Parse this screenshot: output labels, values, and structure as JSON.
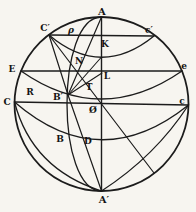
{
  "figure": {
    "background": "#f7f5f0",
    "stroke_color": "#1c1c1c",
    "canvas": {
      "width": 196,
      "height": 212
    },
    "circle": {
      "cx": 101.5,
      "cy": 104,
      "r": 87
    },
    "lines": [
      {
        "id": "axis-A-Aprime",
        "x1": 101.5,
        "y1": 17,
        "x2": 101.5,
        "y2": 191,
        "w": 1.4
      },
      {
        "id": "diameter-C-c",
        "x1": 14.5,
        "y1": 102,
        "x2": 188.5,
        "y2": 105,
        "w": 1.4
      },
      {
        "id": "chord-Cprime-cprime",
        "x1": 49,
        "y1": 35,
        "x2": 154,
        "y2": 36,
        "w": 1.3
      },
      {
        "id": "chord-E-e",
        "x1": 21,
        "y1": 71,
        "x2": 182,
        "y2": 71,
        "w": 1.3
      },
      {
        "id": "diameter-from-Cprime",
        "x1": 49,
        "y1": 35,
        "x2": 154,
        "y2": 173,
        "w": 1.2
      },
      {
        "id": "ray-Bprime-Cprime",
        "x1": 68,
        "y1": 95,
        "x2": 49,
        "y2": 35,
        "w": 1.2
      },
      {
        "id": "ray-Bprime-A",
        "x1": 68,
        "y1": 95,
        "x2": 101.5,
        "y2": 17,
        "w": 1.2
      },
      {
        "id": "ray-Bprime-K",
        "x1": 68,
        "y1": 95,
        "x2": 101.5,
        "y2": 57,
        "w": 1.1
      },
      {
        "id": "ray-Bprime-L",
        "x1": 68,
        "y1": 95,
        "x2": 102,
        "y2": 73,
        "w": 1.1
      },
      {
        "id": "ray-Bprime-Aprime",
        "x1": 68,
        "y1": 95,
        "x2": 101.5,
        "y2": 191,
        "w": 1.2
      }
    ],
    "arcs": [
      {
        "id": "arc-Cprime-cprime-front",
        "type": "quad",
        "p": [
          49,
          35,
          101,
          79,
          154,
          36
        ],
        "w": 1.3
      },
      {
        "id": "arc-E-e-front",
        "type": "quad",
        "p": [
          21,
          71,
          101,
          127,
          182,
          71
        ],
        "w": 1.3
      },
      {
        "id": "arc-C-c-front",
        "type": "quad",
        "p": [
          14.5,
          102,
          100,
          176,
          188.5,
          105
        ],
        "w": 1.3
      },
      {
        "id": "meridian-A-Bprime-Aprime",
        "type": "cubic",
        "p": [
          101.5,
          17,
          55.5,
          17,
          55.5,
          191,
          101.5,
          191
        ],
        "w": 1.3
      },
      {
        "id": "arc-C-Aprime-inner",
        "type": "quad",
        "p": [
          14.5,
          102,
          32,
          169,
          101.5,
          191
        ],
        "w": 1.3
      },
      {
        "id": "arc-c-Aprime-inner",
        "type": "quad",
        "p": [
          188.5,
          105,
          155.5,
          156,
          101.5,
          191
        ],
        "w": 1.3
      }
    ],
    "labels": [
      {
        "id": "A",
        "text": "A",
        "x": 102,
        "y": 11,
        "big": true
      },
      {
        "id": "A-prime",
        "text": "A′",
        "x": 104,
        "y": 199,
        "big": true
      },
      {
        "id": "C",
        "text": "C",
        "x": 7,
        "y": 102
      },
      {
        "id": "c-lower",
        "text": "c",
        "x": 182,
        "y": 101
      },
      {
        "id": "C-prime",
        "text": "C′",
        "x": 45,
        "y": 28
      },
      {
        "id": "c-prime",
        "text": "c′",
        "x": 149,
        "y": 30
      },
      {
        "id": "E",
        "text": "E",
        "x": 12,
        "y": 69
      },
      {
        "id": "e-lower",
        "text": "e",
        "x": 184,
        "y": 66
      },
      {
        "id": "R",
        "text": "R",
        "x": 30,
        "y": 92
      },
      {
        "id": "B-prime",
        "text": "B′",
        "x": 58,
        "y": 97
      },
      {
        "id": "B",
        "text": "B",
        "x": 60,
        "y": 139
      },
      {
        "id": "D",
        "text": "D",
        "x": 88,
        "y": 141
      },
      {
        "id": "K",
        "text": "K",
        "x": 105,
        "y": 44
      },
      {
        "id": "L",
        "text": "L",
        "x": 107,
        "y": 76
      },
      {
        "id": "N",
        "text": "N",
        "x": 79,
        "y": 61
      },
      {
        "id": "T",
        "text": "T",
        "x": 89,
        "y": 87
      },
      {
        "id": "rho",
        "text": "ρ",
        "x": 71,
        "y": 30,
        "greek": true
      },
      {
        "id": "center-O",
        "text": "Ø",
        "x": 93,
        "y": 110
      }
    ]
  }
}
